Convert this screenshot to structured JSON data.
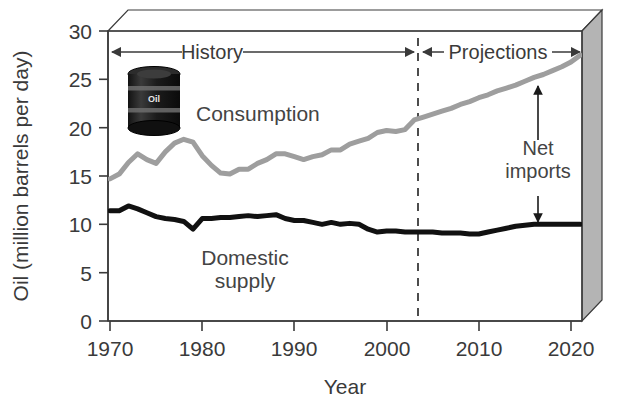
{
  "chart_data": {
    "type": "line",
    "title": "",
    "xlabel": "Year",
    "ylabel": "Oil (million barrels per day)",
    "xlim": [
      1970,
      2021
    ],
    "ylim": [
      0,
      30
    ],
    "xticks": [
      1970,
      1980,
      1990,
      2000,
      2010,
      2020
    ],
    "yticks": [
      0,
      5,
      10,
      15,
      20,
      25,
      30
    ],
    "grid": false,
    "legend": "inline-labels",
    "series": [
      {
        "name": "Consumption",
        "color": "#9e9e9e",
        "x": [
          1970,
          1971,
          1972,
          1973,
          1974,
          1975,
          1976,
          1977,
          1978,
          1979,
          1980,
          1981,
          1982,
          1983,
          1984,
          1985,
          1986,
          1987,
          1988,
          1989,
          1990,
          1991,
          1992,
          1993,
          1994,
          1995,
          1996,
          1997,
          1998,
          1999,
          2000,
          2001,
          2002,
          2003,
          2004,
          2005,
          2006,
          2007,
          2008,
          2009,
          2010,
          2011,
          2012,
          2013,
          2014,
          2015,
          2016,
          2017,
          2018,
          2019,
          2020,
          2021
        ],
        "values": [
          14.7,
          15.2,
          16.4,
          17.3,
          16.7,
          16.3,
          17.5,
          18.4,
          18.8,
          18.5,
          17.1,
          16.1,
          15.3,
          15.2,
          15.7,
          15.7,
          16.3,
          16.7,
          17.3,
          17.3,
          17.0,
          16.7,
          17.0,
          17.2,
          17.7,
          17.7,
          18.3,
          18.6,
          18.9,
          19.5,
          19.7,
          19.6,
          19.8,
          20.8,
          21.1,
          21.4,
          21.7,
          22.0,
          22.4,
          22.7,
          23.1,
          23.4,
          23.8,
          24.1,
          24.4,
          24.8,
          25.2,
          25.5,
          25.9,
          26.3,
          26.8,
          27.5
        ]
      },
      {
        "name": "Domestic supply",
        "color": "#111111",
        "x": [
          1970,
          1971,
          1972,
          1973,
          1974,
          1975,
          1976,
          1977,
          1978,
          1979,
          1980,
          1981,
          1982,
          1983,
          1984,
          1985,
          1986,
          1987,
          1988,
          1989,
          1990,
          1991,
          1992,
          1993,
          1994,
          1995,
          1996,
          1997,
          1998,
          1999,
          2000,
          2001,
          2002,
          2003,
          2004,
          2005,
          2006,
          2007,
          2008,
          2009,
          2010,
          2011,
          2012,
          2013,
          2014,
          2015,
          2016,
          2017,
          2018,
          2019,
          2020,
          2021
        ],
        "values": [
          11.4,
          11.4,
          11.9,
          11.6,
          11.2,
          10.8,
          10.6,
          10.5,
          10.3,
          9.5,
          10.6,
          10.6,
          10.7,
          10.7,
          10.8,
          10.9,
          10.8,
          10.9,
          11.0,
          10.6,
          10.4,
          10.4,
          10.2,
          10.0,
          10.2,
          10.0,
          10.1,
          10.0,
          9.5,
          9.2,
          9.3,
          9.3,
          9.2,
          9.2,
          9.2,
          9.2,
          9.1,
          9.1,
          9.1,
          9.0,
          9.0,
          9.2,
          9.4,
          9.6,
          9.8,
          9.9,
          10.0,
          10.0,
          10.0,
          10.0,
          10.0,
          10.0
        ]
      }
    ],
    "annotations": [
      {
        "name": "history-band",
        "label": "History",
        "x_start": 1970,
        "x_end": 2003
      },
      {
        "name": "projections-band",
        "label": "Projections",
        "x_start": 2003,
        "x_end": 2021
      },
      {
        "name": "divider",
        "label": "",
        "x": 2003,
        "style": "dashed"
      },
      {
        "name": "net-imports",
        "label": "Net imports",
        "x": 2016,
        "y_top": 25.2,
        "y_bottom": 10.0
      }
    ]
  },
  "axes": {
    "y_label": "Oil (million barrels per day)",
    "x_label": "Year",
    "y_ticks": [
      "30",
      "25",
      "20",
      "15",
      "10",
      "5",
      "0"
    ],
    "x_ticks": [
      "1970",
      "1980",
      "1990",
      "2000",
      "2010",
      "2020"
    ]
  },
  "labels": {
    "consumption": "Consumption",
    "domestic_supply_line1": "Domestic",
    "domestic_supply_line2": "supply",
    "history": "History",
    "projections": "Projections",
    "net_imports_line1": "Net",
    "net_imports_line2": "imports",
    "barrel_text": "Oil"
  },
  "colors": {
    "consumption": "#9e9e9e",
    "domestic_supply": "#111111",
    "axis": "#3a3a3a",
    "panel_side": "#b4b4b4",
    "panel_top": "#ffffff",
    "background": "#ffffff"
  }
}
